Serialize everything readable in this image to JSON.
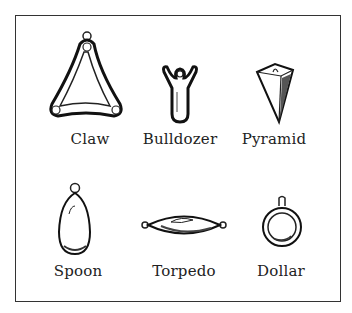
{
  "figure": {
    "items": [
      {
        "label": "Claw",
        "icon": "claw-sinker-icon"
      },
      {
        "label": "Bulldozer",
        "icon": "bulldozer-sinker-icon"
      },
      {
        "label": "Pyramid",
        "icon": "pyramid-sinker-icon"
      },
      {
        "label": "Spoon",
        "icon": "spoon-sinker-icon"
      },
      {
        "label": "Torpedo",
        "icon": "torpedo-sinker-icon"
      },
      {
        "label": "Dollar",
        "icon": "dollar-sinker-icon"
      }
    ],
    "colors": {
      "ink": "#222222",
      "background": "#ffffff"
    }
  }
}
